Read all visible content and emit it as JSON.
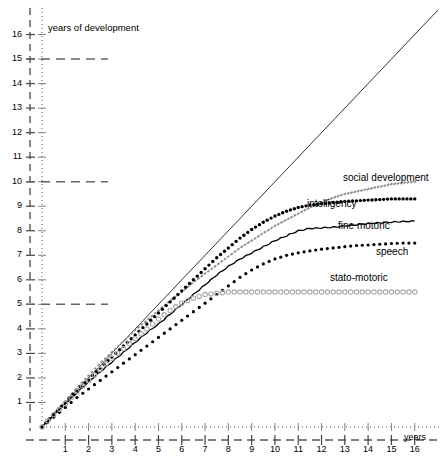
{
  "chart_data": {
    "type": "line",
    "title": "",
    "ylabel": "years of development",
    "xlabel": "years",
    "xlim": [
      0,
      17
    ],
    "ylim": [
      0,
      17
    ],
    "grid": "dashed horizontal gridlines at y = 5, 10, 15",
    "legend_position": "inline labels at right end of each curve",
    "x_ticks": [
      "1",
      "2",
      "3",
      "4",
      "5",
      "6",
      "7",
      "8",
      "9",
      "10",
      "11",
      "12",
      "13",
      "14",
      "15",
      "16"
    ],
    "y_ticks": [
      "1",
      "2",
      "3",
      "4",
      "5",
      "6",
      "7",
      "8",
      "9",
      "10",
      "11",
      "12",
      "13",
      "14",
      "15",
      "16"
    ],
    "gridline_values": [
      5,
      10,
      15
    ],
    "reference_line": {
      "name": "identity-line",
      "from": [
        0,
        0
      ],
      "to": [
        17,
        17
      ],
      "style": "thin solid"
    },
    "x": [
      0,
      0.5,
      1,
      1.5,
      2,
      2.5,
      3,
      3.5,
      4,
      4.5,
      5,
      5.5,
      6,
      6.5,
      7,
      7.5,
      8,
      8.5,
      9,
      9.5,
      10,
      10.5,
      11,
      11.5,
      12,
      12.5,
      13,
      13.5,
      14,
      14.5,
      15,
      15.5,
      16
    ],
    "series": [
      {
        "name": "social development",
        "style": "gray-dashed",
        "color": "#8c8c8c",
        "values": [
          0,
          0.55,
          1.05,
          1.6,
          2.1,
          2.6,
          3.05,
          3.5,
          3.95,
          4.35,
          4.75,
          5.15,
          5.5,
          5.9,
          6.25,
          6.6,
          6.95,
          7.3,
          7.6,
          7.9,
          8.2,
          8.45,
          8.7,
          8.95,
          9.15,
          9.35,
          9.5,
          9.6,
          9.7,
          9.8,
          9.9,
          9.95,
          10.0
        ]
      },
      {
        "name": "intelligency",
        "style": "bold-dotted",
        "color": "#000000",
        "values": [
          0,
          0.5,
          1.0,
          1.5,
          1.95,
          2.4,
          2.85,
          3.3,
          3.75,
          4.2,
          4.65,
          5.1,
          5.55,
          6.0,
          6.45,
          6.9,
          7.3,
          7.7,
          8.05,
          8.35,
          8.6,
          8.8,
          8.95,
          9.05,
          9.1,
          9.15,
          9.2,
          9.22,
          9.25,
          9.27,
          9.3,
          9.3,
          9.3
        ]
      },
      {
        "name": "fine motoric",
        "style": "solid",
        "color": "#000000",
        "values": [
          0,
          0.5,
          0.95,
          1.4,
          1.85,
          2.25,
          2.65,
          3.05,
          3.45,
          3.85,
          4.2,
          4.6,
          5.0,
          5.4,
          5.8,
          6.2,
          6.55,
          6.85,
          7.1,
          7.35,
          7.6,
          7.8,
          8.0,
          8.1,
          8.12,
          8.15,
          8.2,
          8.25,
          8.3,
          8.33,
          8.36,
          8.38,
          8.4
        ]
      },
      {
        "name": "speech",
        "style": "dotted",
        "color": "#000000",
        "values": [
          0,
          0.4,
          0.8,
          1.2,
          1.55,
          1.9,
          2.25,
          2.6,
          2.95,
          3.3,
          3.65,
          4.0,
          4.35,
          4.7,
          5.05,
          5.4,
          5.75,
          6.1,
          6.4,
          6.65,
          6.85,
          7.0,
          7.1,
          7.18,
          7.25,
          7.3,
          7.35,
          7.4,
          7.42,
          7.45,
          7.48,
          7.5,
          7.5
        ]
      },
      {
        "name": "stato-motoric",
        "style": "open-circles",
        "color": "#aaaaaa",
        "values": [
          0,
          0.5,
          0.95,
          1.45,
          1.9,
          2.35,
          2.8,
          3.2,
          3.6,
          4.0,
          4.4,
          4.75,
          5.05,
          5.25,
          5.4,
          5.45,
          5.5,
          5.5,
          5.5,
          5.5,
          5.5,
          5.5,
          5.5,
          5.5,
          5.5,
          5.5,
          5.5,
          5.5,
          5.5,
          5.5,
          5.5,
          5.5,
          5.5
        ]
      }
    ],
    "series_labels": [
      {
        "text": "social development",
        "x_px": 343,
        "y_px": 172
      },
      {
        "text": "intelligency",
        "x_px": 307,
        "y_px": 198
      },
      {
        "text": "fine motoric",
        "x_px": 338,
        "y_px": 220
      },
      {
        "text": "speech",
        "x_px": 376,
        "y_px": 246
      },
      {
        "text": "stato-motoric",
        "x_px": 330,
        "y_px": 272
      }
    ]
  },
  "axes": {
    "y_axis_title": "years of development",
    "x_axis_title": "years"
  }
}
